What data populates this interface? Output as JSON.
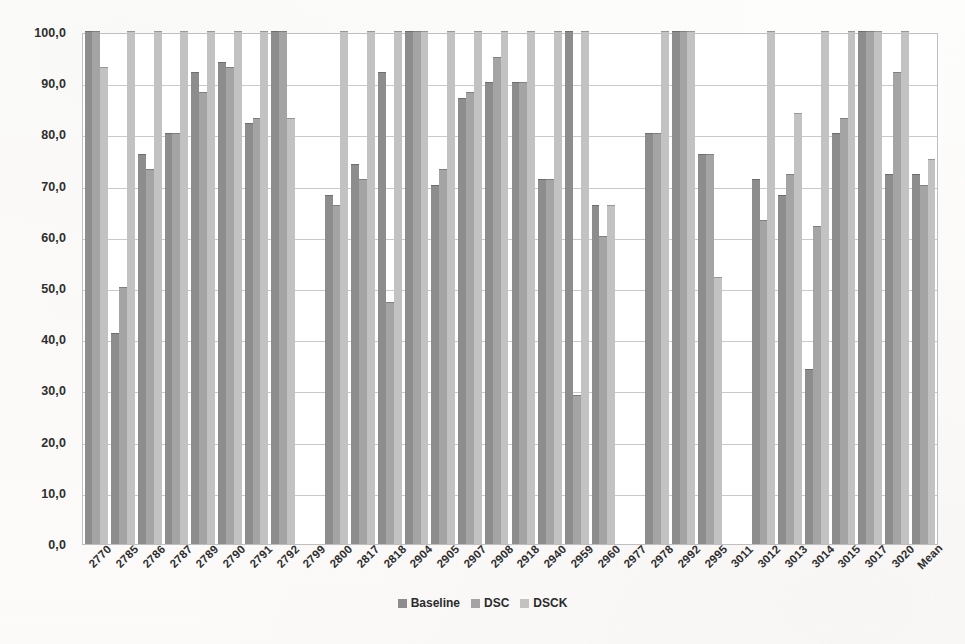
{
  "chart_data": {
    "type": "bar",
    "title": "",
    "subtitle": "",
    "xlabel": "",
    "ylabel": "",
    "ylim": [
      0,
      100
    ],
    "ytick_labels": [
      "0,0",
      "10,0",
      "20,0",
      "30,0",
      "40,0",
      "50,0",
      "60,0",
      "70,0",
      "80,0",
      "90,0",
      "100,0"
    ],
    "ytick_values": [
      0,
      10,
      20,
      30,
      40,
      50,
      60,
      70,
      80,
      90,
      100
    ],
    "grid": true,
    "legend_position": "bottom-center",
    "categories": [
      "2770",
      "2785",
      "2786",
      "2787",
      "2789",
      "2790",
      "2791",
      "2792",
      "2799",
      "2800",
      "2817",
      "2818",
      "2904",
      "2905",
      "2907",
      "2908",
      "2918",
      "2940",
      "2959",
      "2960",
      "2977",
      "2978",
      "2992",
      "2995",
      "3011",
      "3012",
      "3013",
      "3014",
      "3015",
      "3017",
      "3020",
      "Mean"
    ],
    "series": [
      {
        "name": "Baseline",
        "color": "#8d8d8d",
        "values": [
          100.0,
          41.0,
          76.0,
          80.0,
          92.0,
          94.0,
          82.0,
          100.0,
          0.0,
          68.0,
          74.0,
          92.0,
          100.0,
          70.0,
          87.0,
          90.0,
          90.0,
          71.0,
          100.0,
          66.0,
          0.0,
          80.0,
          100.0,
          76.0,
          0.0,
          71.0,
          68.0,
          34.0,
          80.0,
          100.0,
          72.0,
          72.0
        ]
      },
      {
        "name": "DSC",
        "color": "#a4a4a4",
        "values": [
          100.0,
          50.0,
          73.0,
          80.0,
          88.0,
          93.0,
          83.0,
          100.0,
          0.0,
          66.0,
          71.0,
          47.0,
          100.0,
          73.0,
          88.0,
          95.0,
          90.0,
          71.0,
          29.0,
          60.0,
          0.0,
          80.0,
          100.0,
          76.0,
          0.0,
          63.0,
          72.0,
          62.0,
          83.0,
          100.0,
          92.0,
          70.0
        ]
      },
      {
        "name": "DSCK",
        "color": "#c2c2c2",
        "values": [
          93.0,
          100.0,
          100.0,
          100.0,
          100.0,
          100.0,
          100.0,
          83.0,
          0.0,
          100.0,
          100.0,
          100.0,
          100.0,
          100.0,
          100.0,
          100.0,
          100.0,
          100.0,
          100.0,
          66.0,
          0.0,
          100.0,
          100.0,
          52.0,
          0.0,
          100.0,
          84.0,
          100.0,
          100.0,
          100.0,
          100.0,
          75.0
        ]
      }
    ]
  },
  "legend": {
    "items": [
      {
        "label": "Baseline",
        "swatch": "s0"
      },
      {
        "label": "DSC",
        "swatch": "s1"
      },
      {
        "label": "DSCK",
        "swatch": "s2"
      }
    ]
  },
  "colors": {
    "baseline": "#8d8d8d",
    "dsc": "#a4a4a4",
    "dsck": "#c2c2c2",
    "grid": "#c9c9c9",
    "frame": "#bfbfbf",
    "text": "#2e2e2e",
    "background": "#ffffff"
  }
}
